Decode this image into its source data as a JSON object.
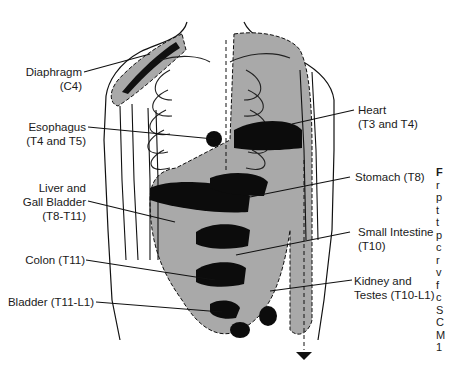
{
  "figure": {
    "colors": {
      "ink": "#111111",
      "shade": "#a9a9a9",
      "background": "#ffffff",
      "dark": "#0c0c0c"
    },
    "labels": [
      {
        "id": "diaphragm",
        "name": "Diaphragm",
        "level": "(C4)",
        "side": "left"
      },
      {
        "id": "esophagus",
        "name": "Esophagus",
        "level": "(T4 and T5)",
        "side": "left"
      },
      {
        "id": "liver",
        "name": "Liver and",
        "name2": "Gall Bladder",
        "level": "(T8-T11)",
        "side": "left"
      },
      {
        "id": "colon",
        "name": "Colon (T11)",
        "side": "left"
      },
      {
        "id": "bladder",
        "name": "Bladder (T11-L1)",
        "side": "left"
      },
      {
        "id": "heart",
        "name": "Heart",
        "level": "(T3 and T4)",
        "side": "right"
      },
      {
        "id": "stomach",
        "name": "Stomach (T8)",
        "side": "right"
      },
      {
        "id": "small-intestine",
        "name": "Small Intestine",
        "level": "(T10)",
        "side": "right"
      },
      {
        "id": "kidney",
        "name": "Kidney and",
        "level": "Testes (T10-L1)",
        "side": "right"
      }
    ],
    "caption_fragments": [
      "F",
      "r",
      "p",
      "t",
      "t",
      "p",
      "c",
      "r",
      "v",
      "f",
      "c",
      "S",
      "C",
      "M",
      "1"
    ]
  }
}
